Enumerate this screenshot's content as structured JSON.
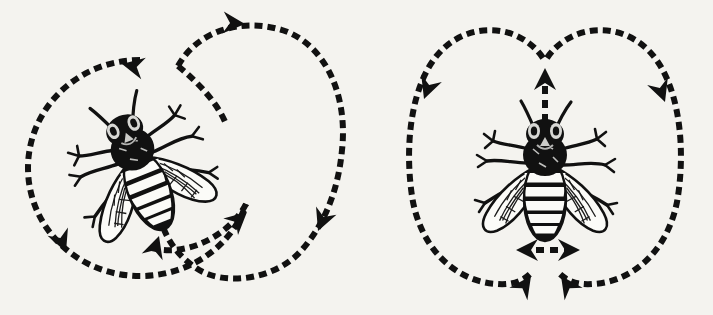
{
  "figure": {
    "title": "Honeybee communication dances",
    "background_color": "#f4f3ef",
    "ink_color": "#111111",
    "width": 713,
    "height": 315,
    "style": "scanned black-and-white engraving on off-white paper",
    "panels": [
      {
        "id": "round-dance",
        "name": "Round dance",
        "position": "left",
        "description": "A honeybee at center with two overlapping dashed circular loop paths marked by solid triangular arrowheads indicating the direction of travel.",
        "bee": {
          "name": "honeybee",
          "orientation_degrees": -22,
          "center_x": 140,
          "center_y": 168,
          "scale": 1.0,
          "parts": [
            "head",
            "compound-eyes",
            "antennae",
            "thorax",
            "striped-abdomen",
            "left-wing",
            "right-wing",
            "six-legs"
          ]
        },
        "paths": [
          {
            "id": "left-loop",
            "shape": "circle",
            "direction": "counterclockwise",
            "cx": 140,
            "cy": 168,
            "rx": 112,
            "ry": 108
          },
          {
            "id": "right-loop",
            "shape": "circle",
            "direction": "clockwise",
            "cx": 237,
            "cy": 152,
            "rx": 108,
            "ry": 128
          }
        ],
        "arrowheads": [
          {
            "id": "arrow-top-left",
            "x": 122,
            "y": 64,
            "angle": 192,
            "meaning": "counterclockwise travel along upper left arc"
          },
          {
            "id": "arrow-bottom-left",
            "x": 66,
            "y": 252,
            "angle": 68,
            "meaning": "continuing down the left side"
          },
          {
            "id": "arrow-top-right",
            "x": 245,
            "y": 24,
            "angle": 4,
            "meaning": "clockwise travel across the top of the right loop"
          },
          {
            "id": "arrow-right",
            "x": 318,
            "y": 231,
            "angle": 112,
            "meaning": "descending the right side of the right loop"
          },
          {
            "id": "arrow-inner-left",
            "x": 159,
            "y": 236,
            "angle": -72,
            "meaning": "return leg rising toward the bee"
          },
          {
            "id": "arrow-inner-right",
            "x": 247,
            "y": 212,
            "angle": -42,
            "meaning": "inner crossing leg rising to the right"
          }
        ],
        "dash": {
          "length": 8,
          "gap": 5,
          "thickness": 6
        }
      },
      {
        "id": "waggle-dance",
        "name": "Waggle dance",
        "position": "right",
        "description": "A honeybee at center with a dashed figure-eight path: two mirrored loops meeting at a cusp above the bee, a vertical dashed straight-run arrow pointing up, and a horizontal double-headed dashed arrow below the abdomen showing the side-to-side waggle.",
        "bee": {
          "name": "honeybee",
          "orientation_degrees": 0,
          "center_x": 545,
          "center_y": 175,
          "scale": 1.0,
          "parts": [
            "head",
            "compound-eyes",
            "antennae",
            "thorax",
            "striped-abdomen",
            "left-wing",
            "right-wing",
            "six-legs"
          ]
        },
        "paths": [
          {
            "id": "left-loop",
            "shape": "teardrop-loop",
            "direction": "counterclockwise",
            "apex_x": 545,
            "apex_y": 56,
            "outer_x": 408,
            "bottom_y": 288
          },
          {
            "id": "right-loop",
            "shape": "teardrop-loop",
            "direction": "clockwise",
            "apex_x": 545,
            "apex_y": 56,
            "outer_x": 682,
            "bottom_y": 288
          },
          {
            "id": "straight-run",
            "shape": "line",
            "x": 545,
            "y_from": 122,
            "y_to": 70,
            "direction": "up",
            "meaning": "straight run indicating direction to food source"
          },
          {
            "id": "waggle-axis",
            "shape": "double-arrow",
            "y": 250,
            "x_from": 516,
            "x_to": 580,
            "meaning": "side-to-side abdomen waggle"
          }
        ],
        "arrowheads": [
          {
            "id": "arrow-left-upper",
            "x": 424,
            "y": 99,
            "angle": 110,
            "meaning": "descending the outer left loop"
          },
          {
            "id": "arrow-right-upper",
            "x": 665,
            "y": 102,
            "angle": 70,
            "meaning": "descending the outer right loop"
          },
          {
            "id": "arrow-return-left",
            "x": 531,
            "y": 276,
            "angle": -55,
            "meaning": "left loop returning up to the start of the straight run"
          },
          {
            "id": "arrow-return-right",
            "x": 561,
            "y": 276,
            "angle": -125,
            "meaning": "right loop returning up to the start of the straight run"
          },
          {
            "id": "arrow-straight-run",
            "x": 545,
            "y": 68,
            "angle": -90,
            "meaning": "direction of the straight run"
          },
          {
            "id": "arrow-waggle-left",
            "x": 516,
            "y": 250,
            "angle": 180,
            "meaning": "waggle to the left"
          },
          {
            "id": "arrow-waggle-right",
            "x": 580,
            "y": 250,
            "angle": 0,
            "meaning": "waggle to the right"
          }
        ],
        "dash": {
          "length": 8,
          "gap": 5,
          "thickness": 6
        }
      }
    ]
  }
}
